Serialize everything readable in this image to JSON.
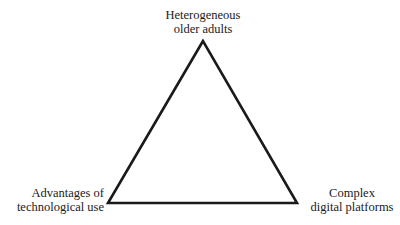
{
  "diagram": {
    "type": "triangle",
    "stroke_color": "#1a1a1a",
    "vertices": {
      "top": {
        "x": 203,
        "y": 41
      },
      "bottom_left": {
        "x": 108,
        "y": 203
      },
      "bottom_right": {
        "x": 297,
        "y": 203
      }
    },
    "labels": {
      "top": {
        "line1": "Heterogeneous",
        "line2": "older adults"
      },
      "bottom_left": {
        "line1": "Advantages of",
        "line2": "technological use"
      },
      "bottom_right": {
        "line1": "Complex",
        "line2": "digital platforms"
      }
    }
  }
}
